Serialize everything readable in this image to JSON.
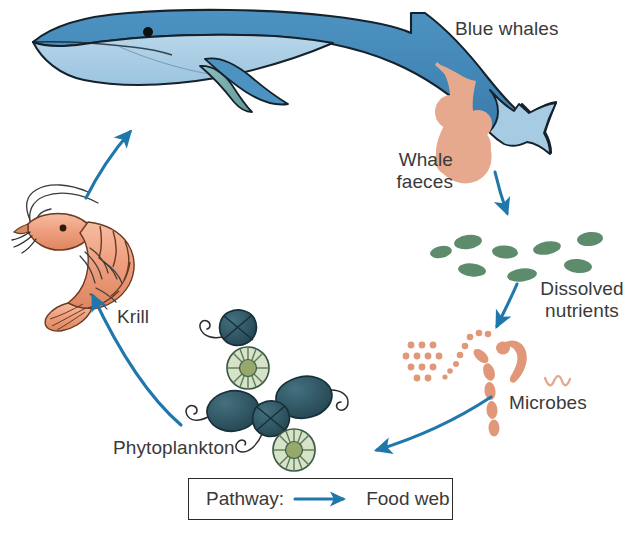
{
  "figure": {
    "background_color": "#ffffff"
  },
  "palette": {
    "arrow_blue": "#1F77AC",
    "whale_dark_blue": "#3D86B8",
    "whale_light_blue": "#A8CBE4",
    "whale_fin_teal": "#6FA9A8",
    "outline": "#1a1a1a",
    "faeces_salmon": "#E7A98D",
    "nutrient_green": "#5D8C6D",
    "microbe_salmon": "#E09878",
    "phyto_dark_teal": "#2E4C58",
    "diatom_green": "#D7E3C8",
    "diatom_center": "#96A86B",
    "krill_orange": "#EFA080",
    "label_text": "#3a3a3a",
    "legend_border": "#2b2b2b"
  },
  "labels": {
    "blue_whales": "Blue whales",
    "whale_faeces": "Whale\nfaeces",
    "dissolved_nutrients": "Dissolved\nnutrients",
    "microbes": "Microbes",
    "krill": "Krill",
    "phytoplankton": "Phytoplankton"
  },
  "legend": {
    "pathway_label": "Pathway:",
    "series_label": "Food web",
    "arrow_color": "#1F77AC"
  },
  "nodes": [
    {
      "id": "blue-whales",
      "label": "Blue whales",
      "kind": "organism"
    },
    {
      "id": "whale-faeces",
      "label": "Whale faeces",
      "kind": "material"
    },
    {
      "id": "dissolved-nutrients",
      "label": "Dissolved nutrients",
      "kind": "material"
    },
    {
      "id": "microbes",
      "label": "Microbes",
      "kind": "organism"
    },
    {
      "id": "phytoplankton",
      "label": "Phytoplankton",
      "kind": "organism"
    },
    {
      "id": "krill",
      "label": "Krill",
      "kind": "organism"
    }
  ],
  "arrows": [
    {
      "id": "krill-to-whales",
      "from": "krill",
      "to": "blue-whales",
      "pathway": "Food web"
    },
    {
      "id": "faeces-to-nutrients",
      "from": "whale-faeces",
      "to": "dissolved-nutrients",
      "pathway": "Food web"
    },
    {
      "id": "nutrients-to-microbes",
      "from": "dissolved-nutrients",
      "to": "microbes",
      "pathway": "Food web"
    },
    {
      "id": "microbes-to-phyto",
      "from": "microbes",
      "to": "phytoplankton",
      "pathway": "Food web"
    },
    {
      "id": "phyto-to-krill",
      "from": "phytoplankton",
      "to": "krill",
      "pathway": "Food web"
    }
  ],
  "organisms": {
    "nutrient_blobs": 8,
    "diatoms": 2,
    "dinoflagellates": 4,
    "microbe_forms": [
      "dot-grid",
      "dot-chain",
      "comma-bacillus",
      "rod-chain",
      "squiggle"
    ]
  }
}
